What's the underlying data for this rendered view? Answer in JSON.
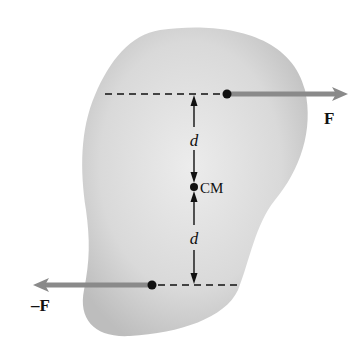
{
  "diagram": {
    "labels": {
      "force_top": "F",
      "force_bottom": "–F",
      "distance_top": "d",
      "distance_bottom": "d",
      "center_of_mass": "CM"
    },
    "colors": {
      "body_fill": "#cfcfcf",
      "body_fill_light": "#e6e6e6",
      "arrow": "#8a8a8a",
      "line": "#111111",
      "background": "#ffffff"
    }
  }
}
